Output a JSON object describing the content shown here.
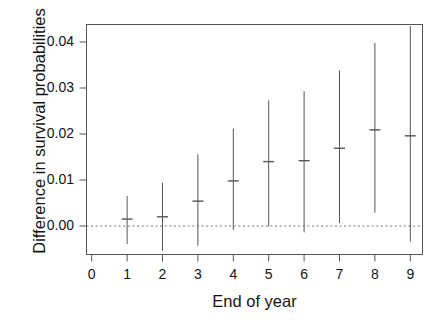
{
  "chart_data": {
    "type": "scatter",
    "title": "",
    "xlabel": "End of year",
    "ylabel": "Difference in survival probabilities",
    "xlim": [
      -0.35,
      9.35
    ],
    "ylim": [
      -0.0062,
      0.0446
    ],
    "xticks": [
      0,
      1,
      2,
      3,
      4,
      5,
      6,
      7,
      8,
      9
    ],
    "xticklabels": [
      "0",
      "1",
      "2",
      "3",
      "4",
      "5",
      "6",
      "7",
      "8",
      "9"
    ],
    "yticks": [
      0.0,
      0.01,
      0.02,
      0.03,
      0.04
    ],
    "yticklabels": [
      "0.00",
      "0.01",
      "0.02",
      "0.03",
      "0.04"
    ],
    "grid": false,
    "legend": null,
    "reference_line": {
      "y": 0.0,
      "style": "dotted",
      "color": "#777777"
    },
    "categories": [
      1,
      2,
      3,
      4,
      5,
      6,
      7,
      8,
      9
    ],
    "series": [
      {
        "name": "Difference in survival probabilities",
        "marker": "point-with-error-bar",
        "color": "#555555",
        "values": [
          0.0015,
          0.002,
          0.0054,
          0.0098,
          0.014,
          0.0142,
          0.0169,
          0.0209,
          0.0196
        ],
        "error_low": [
          -0.0039,
          -0.0054,
          -0.0043,
          -0.0009,
          -0.0001,
          -0.0014,
          0.0006,
          0.0029,
          -0.0034
        ],
        "error_high": [
          0.0065,
          0.0094,
          0.0156,
          0.0212,
          0.0273,
          0.0293,
          0.0338,
          0.0398,
          0.0435
        ]
      }
    ],
    "points": [
      {
        "x": 1,
        "estimate": 0.0015,
        "lower": -0.0039,
        "upper": 0.0065
      },
      {
        "x": 2,
        "estimate": 0.002,
        "lower": -0.0054,
        "upper": 0.0094
      },
      {
        "x": 3,
        "estimate": 0.0054,
        "lower": -0.0043,
        "upper": 0.0156
      },
      {
        "x": 4,
        "estimate": 0.0098,
        "lower": -0.0009,
        "upper": 0.0212
      },
      {
        "x": 5,
        "estimate": 0.014,
        "lower": -0.0001,
        "upper": 0.0273
      },
      {
        "x": 6,
        "estimate": 0.0142,
        "lower": -0.0014,
        "upper": 0.0293
      },
      {
        "x": 7,
        "estimate": 0.0169,
        "lower": 0.0006,
        "upper": 0.0338
      },
      {
        "x": 8,
        "estimate": 0.0209,
        "lower": 0.0029,
        "upper": 0.0398
      },
      {
        "x": 9,
        "estimate": 0.0196,
        "lower": -0.0034,
        "upper": 0.0435
      }
    ]
  },
  "colors": {
    "axis": "#555555",
    "data": "#555555",
    "reference": "#808080",
    "text": "#141414",
    "background": "#ffffff"
  }
}
